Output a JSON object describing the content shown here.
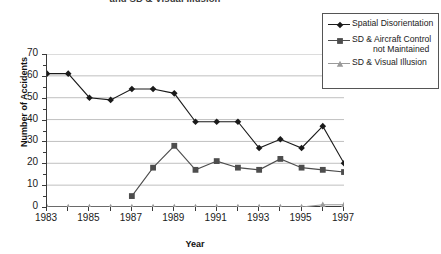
{
  "chart_data": {
    "type": "line",
    "title": "and SD & Visual Illusion",
    "xlabel": "Year",
    "ylabel": "Number of Accidents",
    "xlim": [
      1983,
      1997
    ],
    "ylim": [
      0,
      70
    ],
    "ytick_values": [
      0,
      10,
      20,
      30,
      40,
      50,
      60,
      70
    ],
    "xtick_values": [
      1983,
      1985,
      1987,
      1989,
      1991,
      1993,
      1995,
      1997
    ],
    "xtick_labels": [
      "1983",
      "1985",
      "1987",
      "1989",
      "1991",
      "1993",
      "1995",
      "1997"
    ],
    "x": [
      1983,
      1984,
      1985,
      1986,
      1987,
      1988,
      1989,
      1990,
      1991,
      1992,
      1993,
      1994,
      1995,
      1996,
      1997
    ],
    "grid": "horizontal",
    "legend_position": "upper-right-outside",
    "series": [
      {
        "name": "Spatial Disorientation",
        "marker": "diamond",
        "color": "#1a1a1a",
        "values": [
          61,
          61,
          50,
          49,
          54,
          54,
          52,
          39,
          39,
          39,
          27,
          31,
          27,
          37,
          20
        ]
      },
      {
        "name": "SD & Aircraft Control not Maintained",
        "marker": "square",
        "color": "#4d4d4d",
        "values": [
          null,
          null,
          null,
          null,
          5,
          18,
          28,
          17,
          21,
          18,
          17,
          22,
          18,
          17,
          16
        ]
      },
      {
        "name": "SD & Visual Illusion",
        "marker": "triangle",
        "color": "#9a9a9a",
        "values": [
          0,
          0,
          0,
          0,
          0,
          0,
          0,
          0,
          0,
          0,
          0,
          0,
          0,
          1,
          1
        ]
      }
    ]
  },
  "legend": {
    "entries": [
      {
        "label": "Spatial Disorientation",
        "line2": ""
      },
      {
        "label": "SD & Aircraft Control",
        "line2": "not Maintained"
      },
      {
        "label": "SD & Visual Illusion",
        "line2": ""
      }
    ]
  }
}
